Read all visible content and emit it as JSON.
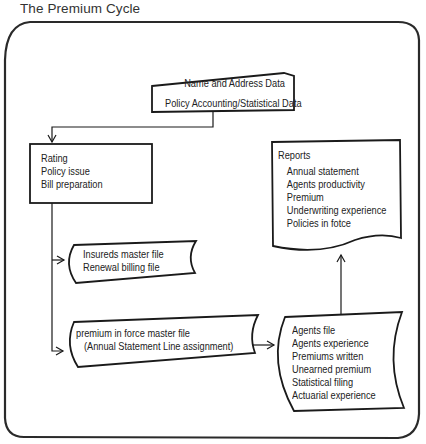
{
  "title": "The Premium Cycle",
  "nodes": {
    "input": {
      "shape": "manual-input",
      "lines": [
        "Name and Address Data",
        "Policy Accounting/Statistical Data"
      ]
    },
    "process": {
      "shape": "process",
      "lines": [
        "Rating",
        "Policy issue",
        "Bill preparation"
      ]
    },
    "insureds_file": {
      "shape": "stored-data",
      "lines": [
        "Insureds master file",
        "Renewal billing file"
      ]
    },
    "premium_file": {
      "shape": "stored-data",
      "lines": [
        "premium in force master file",
        "(Annual Statement Line assignment)"
      ]
    },
    "agents_file": {
      "shape": "stored-data",
      "lines": [
        "Agents file",
        "Agents experience",
        "Premiums written",
        "Unearned premium",
        "Statistical filing",
        "Actuarial experience"
      ]
    },
    "reports": {
      "shape": "document",
      "heading": "Reports",
      "lines": [
        "Annual statement",
        "Agents productivity",
        "Premium",
        "Underwriting experience",
        "Policies in fotce"
      ]
    }
  },
  "edges": [
    {
      "from": "input",
      "to": "process"
    },
    {
      "from": "process",
      "to": "insureds_file"
    },
    {
      "from": "process",
      "to": "premium_file"
    },
    {
      "from": "premium_file",
      "to": "agents_file"
    },
    {
      "from": "agents_file",
      "to": "reports"
    }
  ],
  "colors": {
    "line": "#1a1a1a",
    "frame": "#2a2a2a",
    "background": "#ffffff"
  }
}
